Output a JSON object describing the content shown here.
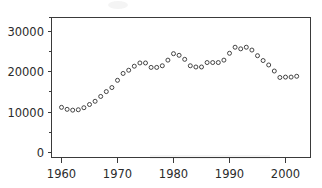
{
  "chart_data": {
    "type": "scatter",
    "title": "",
    "subtitle": "",
    "xlabel": "",
    "ylabel": "",
    "xlim": [
      1958.5,
      2003.5
    ],
    "ylim": [
      0,
      32500
    ],
    "grid": false,
    "legend": null,
    "marker_style": "open-circle",
    "xticks": [
      1960,
      1970,
      1980,
      1990,
      2000
    ],
    "xtick_labels": [
      "1960",
      "1970",
      "1980",
      "1990",
      "2000"
    ],
    "xminorticks": [
      1965,
      1975,
      1985,
      1995
    ],
    "yticks": [
      0,
      10000,
      20000,
      30000
    ],
    "ytick_labels": [
      "0",
      "10000",
      "20000",
      "30000"
    ],
    "yminorticks": [
      5000,
      15000,
      25000
    ],
    "x": [
      1960,
      1961,
      1962,
      1963,
      1964,
      1965,
      1966,
      1967,
      1968,
      1969,
      1970,
      1971,
      1972,
      1973,
      1974,
      1975,
      1976,
      1977,
      1978,
      1979,
      1980,
      1981,
      1982,
      1983,
      1984,
      1985,
      1986,
      1987,
      1988,
      1989,
      1990,
      1991,
      1992,
      1993,
      1994,
      1995,
      1996,
      1997,
      1998,
      1999,
      2000,
      2001,
      2002
    ],
    "values": [
      11200,
      10700,
      10500,
      10600,
      11100,
      11900,
      12700,
      13900,
      15100,
      16100,
      17900,
      19600,
      20400,
      21400,
      22200,
      22200,
      21100,
      21100,
      21500,
      22900,
      24500,
      24100,
      23100,
      21500,
      21200,
      21200,
      22300,
      22300,
      22300,
      22900,
      24600,
      26100,
      25700,
      26100,
      25400,
      24000,
      22800,
      21700,
      20200,
      18600,
      18700,
      18700,
      18900
    ]
  },
  "axes": {
    "ytick_labels": [
      "30000",
      "20000",
      "10000",
      "0"
    ],
    "xtick_labels": [
      "1960",
      "1970",
      "1980",
      "1990",
      "2000"
    ]
  }
}
